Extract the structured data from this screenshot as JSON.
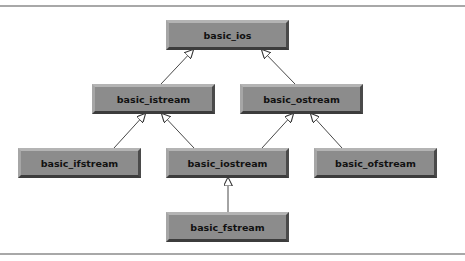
{
  "diagram": {
    "type": "class-inheritance-hierarchy",
    "nodes": [
      {
        "id": "basic_ios",
        "label": "basic_ios"
      },
      {
        "id": "basic_istream",
        "label": "basic_istream"
      },
      {
        "id": "basic_ostream",
        "label": "basic_ostream"
      },
      {
        "id": "basic_ifstream",
        "label": "basic_ifstream"
      },
      {
        "id": "basic_iostream",
        "label": "basic_iostream"
      },
      {
        "id": "basic_ofstream",
        "label": "basic_ofstream"
      },
      {
        "id": "basic_fstream",
        "label": "basic_fstream"
      }
    ],
    "edges": [
      {
        "from": "basic_istream",
        "to": "basic_ios",
        "kind": "inherits"
      },
      {
        "from": "basic_ostream",
        "to": "basic_ios",
        "kind": "inherits"
      },
      {
        "from": "basic_ifstream",
        "to": "basic_istream",
        "kind": "inherits"
      },
      {
        "from": "basic_iostream",
        "to": "basic_istream",
        "kind": "inherits"
      },
      {
        "from": "basic_iostream",
        "to": "basic_ostream",
        "kind": "inherits"
      },
      {
        "from": "basic_ofstream",
        "to": "basic_ostream",
        "kind": "inherits"
      },
      {
        "from": "basic_fstream",
        "to": "basic_iostream",
        "kind": "inherits"
      }
    ],
    "colors": {
      "node_fill": "#8c8c8c",
      "node_text": "#111111",
      "edge": "#333333",
      "rule": "#a8a8a8"
    }
  }
}
